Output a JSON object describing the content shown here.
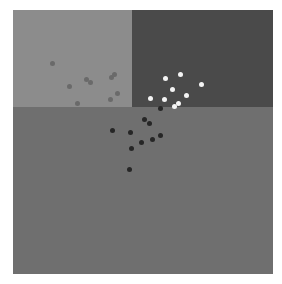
{
  "stimulus": {
    "frame": {
      "x": 13,
      "y": 10,
      "width": 260,
      "height": 264
    },
    "regions": [
      {
        "name": "top-left-light-panel",
        "x": 13,
        "y": 10,
        "width": 119,
        "height": 97,
        "color": "#8c8c8c"
      },
      {
        "name": "top-right-dark-panel",
        "x": 132,
        "y": 10,
        "width": 141,
        "height": 97,
        "color": "#4a4a4a"
      },
      {
        "name": "bottom-mid-panel",
        "x": 13,
        "y": 107,
        "width": 260,
        "height": 167,
        "color": "#6f6f6f"
      }
    ],
    "dot_groups": [
      {
        "name": "grey-dots",
        "color": "#6a6a6a",
        "size": 5,
        "points": [
          [
            52,
            63
          ],
          [
            69,
            86
          ],
          [
            86,
            79
          ],
          [
            90,
            82
          ],
          [
            111,
            77
          ],
          [
            114,
            74
          ],
          [
            117,
            93
          ],
          [
            110,
            99
          ],
          [
            77,
            103
          ]
        ]
      },
      {
        "name": "white-dots",
        "color": "#f4f4f4",
        "size": 5,
        "points": [
          [
            165,
            78
          ],
          [
            180,
            74
          ],
          [
            172,
            89
          ],
          [
            150,
            98
          ],
          [
            164,
            99
          ],
          [
            186,
            95
          ],
          [
            201,
            84
          ],
          [
            178,
            103
          ],
          [
            174,
            106
          ]
        ]
      },
      {
        "name": "black-dots",
        "color": "#262626",
        "size": 5,
        "points": [
          [
            160,
            108
          ],
          [
            144,
            119
          ],
          [
            149,
            123
          ],
          [
            112,
            130
          ],
          [
            130,
            132
          ],
          [
            131,
            148
          ],
          [
            141,
            142
          ],
          [
            152,
            139
          ],
          [
            160,
            135
          ],
          [
            129,
            169
          ]
        ]
      }
    ]
  }
}
